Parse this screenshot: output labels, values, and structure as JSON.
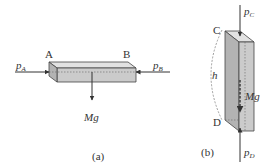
{
  "figure_a": {
    "caption": "(a)",
    "label_a": "A",
    "label_b": "B",
    "force_left": {
      "symbol": "p",
      "subscript": "A"
    },
    "force_right": {
      "symbol": "p",
      "subscript": "B"
    },
    "weight": "Mg"
  },
  "figure_b": {
    "caption": "(b)",
    "label_c": "C",
    "label_d": "D",
    "height": "h",
    "force_top": {
      "symbol": "p",
      "subscript": "C"
    },
    "force_bottom": {
      "symbol": "p",
      "subscript": "D"
    },
    "weight": "Mg"
  },
  "colors": {
    "block_face": "#cfcfcf",
    "block_top": "#e0e0e0",
    "block_side": "#b0b0b0",
    "stroke": "#444444"
  }
}
